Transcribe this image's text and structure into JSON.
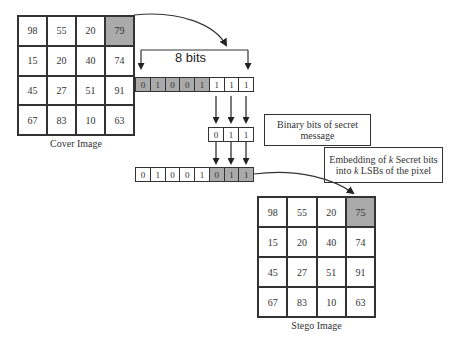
{
  "cover_image": {
    "caption": "Cover Image",
    "rows": [
      [
        "98",
        "55",
        "20",
        "79"
      ],
      [
        "15",
        "20",
        "40",
        "74"
      ],
      [
        "45",
        "27",
        "51",
        "91"
      ],
      [
        "67",
        "83",
        "10",
        "63"
      ]
    ],
    "highlighted_cell": [
      0,
      3
    ]
  },
  "stego_image": {
    "caption": "Stego Image",
    "rows": [
      [
        "98",
        "55",
        "20",
        "75"
      ],
      [
        "15",
        "20",
        "40",
        "74"
      ],
      [
        "45",
        "27",
        "51",
        "91"
      ],
      [
        "67",
        "83",
        "10",
        "63"
      ]
    ],
    "highlighted_cell": [
      0,
      3
    ]
  },
  "bits_label": "8 bits",
  "original_pixel_bits": [
    "0",
    "1",
    "0",
    "0",
    "1",
    "1",
    "1",
    "1"
  ],
  "secret_bits": [
    "0",
    "1",
    "1"
  ],
  "embedded_pixel_bits": [
    "0",
    "1",
    "0",
    "0",
    "1",
    "0",
    "1",
    "1"
  ],
  "annotations": {
    "secret_message": "Binary bits of secret message",
    "embedding_line1": "Embedding of ",
    "embedding_k1": "k",
    "embedding_line2": " Secret bits into ",
    "embedding_k2": "k",
    "embedding_line3": " LSBs of the pixel"
  },
  "colors": {
    "highlight": "#aaaaaa",
    "line": "#333333"
  }
}
